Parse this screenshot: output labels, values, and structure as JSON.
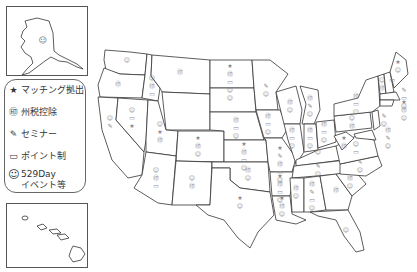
{
  "legend": {
    "items": [
      {
        "icon": "star-icon",
        "glyph": "★",
        "label": "マッチング拠出"
      },
      {
        "icon": "coins-icon",
        "glyph": "㊞",
        "label": "州税控除"
      },
      {
        "icon": "pen-icon",
        "glyph": "✎",
        "label": "セミナー"
      },
      {
        "icon": "card-icon",
        "glyph": "▭",
        "label": "ポイント制"
      },
      {
        "icon": "smiley-icon",
        "glyph": "☺",
        "label": "529Day\nイベント等"
      }
    ]
  },
  "insets": {
    "alaska": {
      "label": "Alaska",
      "markers": [
        "smiley"
      ]
    },
    "hawaii": {
      "label": "Hawaii",
      "markers": [
        "smiley"
      ]
    }
  },
  "glyphs": {
    "smiley": "☺",
    "coins": "㊞",
    "star": "★",
    "pen": "✎",
    "card": "▭"
  },
  "states": [
    {
      "name": "WA",
      "markers": [
        "smiley"
      ]
    },
    {
      "name": "OR",
      "markers": [
        "coins"
      ]
    },
    {
      "name": "ID",
      "markers": [
        "smiley",
        "coins",
        "card"
      ]
    },
    {
      "name": "MT",
      "markers": [
        "coins"
      ]
    },
    {
      "name": "CA",
      "markers": [
        "smiley",
        "pen"
      ]
    },
    {
      "name": "NV",
      "markers": [
        "smiley",
        "card",
        "star"
      ]
    },
    {
      "name": "UT",
      "markers": [
        "smiley",
        "star",
        "coins"
      ]
    },
    {
      "name": "CO",
      "markers": [
        "star",
        "coins",
        "smiley"
      ]
    },
    {
      "name": "AZ",
      "markers": [
        "smiley",
        "coins",
        "card"
      ]
    },
    {
      "name": "NM",
      "markers": [
        "smiley",
        "coins"
      ]
    },
    {
      "name": "ND",
      "markers": [
        "star",
        "coins",
        "card",
        "smiley"
      ]
    },
    {
      "name": "SD",
      "markers": [
        "smiley"
      ]
    },
    {
      "name": "NE",
      "markers": [
        "coins",
        "card",
        "smiley"
      ]
    },
    {
      "name": "KS",
      "markers": [
        "star",
        "coins",
        "card",
        "smiley"
      ]
    },
    {
      "name": "OK",
      "markers": [
        "coins",
        "smiley"
      ]
    },
    {
      "name": "TX",
      "markers": [
        "star",
        "smiley"
      ]
    },
    {
      "name": "MN",
      "markers": [
        "pen",
        "smiley"
      ]
    },
    {
      "name": "IA",
      "markers": [
        "coins",
        "card",
        "smiley"
      ]
    },
    {
      "name": "MO",
      "markers": [
        "star",
        "pen",
        "coins",
        "card",
        "smiley"
      ]
    },
    {
      "name": "AR",
      "markers": [
        "star",
        "coins",
        "card",
        "smiley"
      ]
    },
    {
      "name": "LA",
      "markers": [
        "star",
        "coins",
        "smiley"
      ]
    },
    {
      "name": "WI",
      "markers": [
        "coins",
        "smiley"
      ]
    },
    {
      "name": "IL",
      "markers": [
        "coins",
        "card",
        "smiley"
      ]
    },
    {
      "name": "MI",
      "markers": [
        "coins",
        "pen",
        "smiley"
      ]
    },
    {
      "name": "IN",
      "markers": [
        "coins",
        "card",
        "smiley"
      ]
    },
    {
      "name": "OH",
      "markers": [
        "coins",
        "card",
        "smiley"
      ]
    },
    {
      "name": "KY",
      "markers": [
        "smiley"
      ]
    },
    {
      "name": "TN",
      "markers": [
        "pen",
        "smiley"
      ]
    },
    {
      "name": "MS",
      "markers": [
        "coins",
        "smiley"
      ]
    },
    {
      "name": "AL",
      "markers": [
        "coins",
        "pen",
        "card",
        "smiley"
      ]
    },
    {
      "name": "GA",
      "markers": [
        "coins"
      ]
    },
    {
      "name": "FL",
      "markers": [
        "smiley"
      ]
    },
    {
      "name": "SC",
      "markers": [
        "coins",
        "smiley"
      ]
    },
    {
      "name": "NC",
      "markers": [
        "pen",
        "smiley"
      ]
    },
    {
      "name": "VA",
      "markers": [
        "smiley",
        "card"
      ]
    },
    {
      "name": "WV",
      "markers": [
        "star",
        "coins"
      ]
    },
    {
      "name": "PA",
      "markers": [
        "smiley",
        "coins"
      ]
    },
    {
      "name": "NY",
      "markers": [
        "coins",
        "card",
        "smiley"
      ]
    },
    {
      "name": "ME",
      "markers": [
        "star",
        "smiley"
      ]
    },
    {
      "name": "VT",
      "markers": [
        "smiley",
        "coins"
      ]
    },
    {
      "name": "NH",
      "markers": [
        "card"
      ]
    },
    {
      "name": "MA",
      "markers": [
        "pen",
        "card",
        "smiley"
      ]
    },
    {
      "name": "CT",
      "markers": [
        "star",
        "coins",
        "smiley"
      ]
    },
    {
      "name": "NJ",
      "markers": [
        "pen",
        "smiley"
      ]
    },
    {
      "name": "MD",
      "markers": [
        "coins",
        "pen",
        "smiley"
      ]
    }
  ]
}
